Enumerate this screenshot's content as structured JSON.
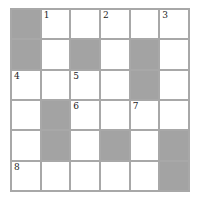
{
  "puzzle": {
    "rows": 6,
    "cols": 6,
    "colors": {
      "block": "#a3a3a3",
      "border": "#a8a8a8",
      "cell": "#ffffff"
    },
    "grid": [
      [
        {
          "b": 1
        },
        {
          "n": "1"
        },
        {},
        {
          "n": "2"
        },
        {},
        {
          "n": "3"
        }
      ],
      [
        {
          "b": 1
        },
        {},
        {
          "b": 1
        },
        {},
        {
          "b": 1
        },
        {}
      ],
      [
        {
          "n": "4"
        },
        {},
        {
          "n": "5"
        },
        {},
        {
          "b": 1
        },
        {}
      ],
      [
        {},
        {
          "b": 1
        },
        {
          "n": "6"
        },
        {},
        {
          "n": "7"
        },
        {}
      ],
      [
        {},
        {
          "b": 1
        },
        {},
        {
          "b": 1
        },
        {},
        {
          "b": 1
        }
      ],
      [
        {
          "n": "8"
        },
        {},
        {},
        {},
        {},
        {
          "b": 1
        }
      ]
    ]
  }
}
